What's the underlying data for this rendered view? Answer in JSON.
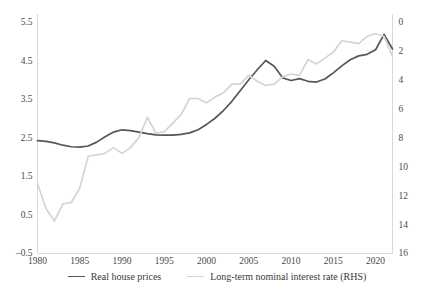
{
  "chart_data": {
    "type": "line",
    "title": "",
    "xlabel": "",
    "ylabel": "",
    "grid": false,
    "legend_position": "bottom",
    "x": [
      1980,
      1981,
      1982,
      1983,
      1984,
      1985,
      1986,
      1987,
      1988,
      1989,
      1990,
      1991,
      1992,
      1993,
      1994,
      1995,
      1996,
      1997,
      1998,
      1999,
      2000,
      2001,
      2002,
      2003,
      2004,
      2005,
      2006,
      2007,
      2008,
      2009,
      2010,
      2011,
      2012,
      2013,
      2014,
      2015,
      2016,
      2017,
      2018,
      2019,
      2020,
      2021,
      2022
    ],
    "xticks": [
      1980,
      1985,
      1990,
      1995,
      2000,
      2005,
      2010,
      2015,
      2020
    ],
    "xlim": [
      1980,
      2022
    ],
    "left_axis": {
      "name": "Real house prices",
      "ticks": [
        5.5,
        4.5,
        3.5,
        2.5,
        1.5,
        0.5,
        -0.5
      ],
      "ylim": [
        -0.5,
        5.5
      ],
      "inverted": false
    },
    "right_axis": {
      "name": "Long-term nominal interest rate (RHS)",
      "ticks": [
        0,
        2,
        4,
        6,
        8,
        10,
        12,
        14,
        16
      ],
      "ylim": [
        0,
        16
      ],
      "inverted": true,
      "unit": "percent"
    },
    "series": [
      {
        "name": "Real house prices",
        "axis": "left",
        "color": "#565656",
        "width": 1.7,
        "values": [
          2.42,
          2.4,
          2.36,
          2.3,
          2.26,
          2.25,
          2.28,
          2.38,
          2.52,
          2.64,
          2.7,
          2.68,
          2.64,
          2.6,
          2.57,
          2.56,
          2.56,
          2.58,
          2.62,
          2.7,
          2.84,
          3.0,
          3.2,
          3.44,
          3.72,
          4.0,
          4.26,
          4.5,
          4.35,
          4.05,
          3.98,
          4.03,
          3.96,
          3.94,
          4.02,
          4.18,
          4.36,
          4.52,
          4.62,
          4.66,
          4.78,
          5.18,
          4.8
        ]
      },
      {
        "name": "Long-term nominal interest rate (RHS)",
        "axis": "right",
        "color": "#d4d4d4",
        "width": 1.7,
        "values": [
          11.2,
          12.9,
          13.8,
          12.6,
          12.5,
          11.5,
          9.3,
          9.2,
          9.1,
          8.7,
          9.1,
          8.7,
          8.0,
          6.6,
          7.7,
          7.6,
          7.0,
          6.4,
          5.3,
          5.3,
          5.6,
          5.2,
          4.9,
          4.3,
          4.3,
          3.7,
          4.1,
          4.4,
          4.3,
          3.8,
          3.6,
          3.7,
          2.6,
          2.9,
          2.5,
          2.1,
          1.3,
          1.4,
          1.5,
          1.0,
          0.8,
          1.0,
          2.4
        ]
      }
    ]
  },
  "legend": {
    "items": [
      {
        "label": "Real house prices",
        "color": "#565656"
      },
      {
        "label": "Long-term nominal interest rate (RHS)",
        "color": "#d4d4d4"
      }
    ]
  }
}
